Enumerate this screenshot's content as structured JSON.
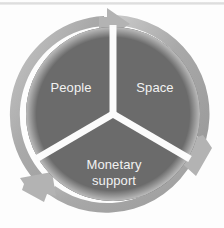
{
  "diagram": {
    "type": "cycle-diagram",
    "title": "",
    "shape": "three-segment-circular-arrow-cycle",
    "direction": "clockwise",
    "segment_count": 3,
    "segments": [
      {
        "id": "people",
        "label": "People",
        "position": "upper-left",
        "label_lines": [
          "People"
        ],
        "angle_start_deg": 240,
        "angle_end_deg": 360
      },
      {
        "id": "space",
        "label": "Space",
        "position": "upper-right",
        "label_lines": [
          "Space"
        ],
        "angle_start_deg": 0,
        "angle_end_deg": 120
      },
      {
        "id": "monetary-support",
        "label": "Monetary support",
        "position": "bottom",
        "label_lines": [
          "Monetary",
          "support"
        ],
        "angle_start_deg": 120,
        "angle_end_deg": 240
      }
    ],
    "arrows": [
      {
        "id": "arrow-top",
        "points_to": "space",
        "clock_position": "12 o'clock"
      },
      {
        "id": "arrow-lower-right",
        "points_to": "monetary-support",
        "clock_position": "4 o'clock"
      },
      {
        "id": "arrow-lower-left",
        "points_to": "people",
        "clock_position": "8 o'clock"
      }
    ],
    "colors": {
      "background": "#fdfdfd",
      "segment_fill": "#6b6b6b",
      "segment_fill_dark": "#626262",
      "ring_arrow": "#a9a9a9",
      "ring_arrow_light": "#c4c4c4",
      "divider": "#fbfbfb",
      "label_text": "#f2f2f2",
      "scan_line": "#dedede"
    },
    "geometry": {
      "center_x": 113,
      "center_y": 114,
      "outer_radius": 99,
      "ring_inner_radius": 89,
      "disc_radius": 87,
      "divider_width": 7
    }
  }
}
